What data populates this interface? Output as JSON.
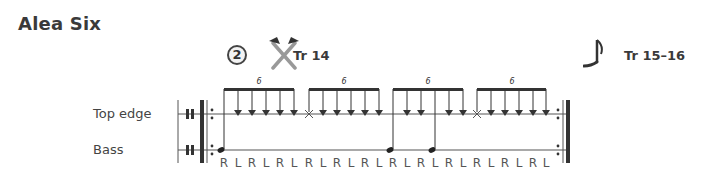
{
  "title": "Alea Six",
  "marker": {
    "number": "2",
    "icon": "crossed-hammers-icon",
    "track_label": "Tr 14"
  },
  "tempo_marker": {
    "icon": "eighth-note-icon",
    "track_label": "Tr 15–16"
  },
  "staves": [
    {
      "label": "Top edge"
    },
    {
      "label": "Bass"
    }
  ],
  "tuplets": [
    "6",
    "6",
    "6",
    "6"
  ],
  "notes": [
    {
      "voice": "bass"
    },
    {
      "voice": "top"
    },
    {
      "voice": "top"
    },
    {
      "voice": "top"
    },
    {
      "voice": "top"
    },
    {
      "voice": "top"
    },
    {
      "voice": "top-x"
    },
    {
      "voice": "top"
    },
    {
      "voice": "top"
    },
    {
      "voice": "top"
    },
    {
      "voice": "top"
    },
    {
      "voice": "top"
    },
    {
      "voice": "bass"
    },
    {
      "voice": "top"
    },
    {
      "voice": "top"
    },
    {
      "voice": "bass"
    },
    {
      "voice": "top"
    },
    {
      "voice": "top"
    },
    {
      "voice": "top-x"
    },
    {
      "voice": "top"
    },
    {
      "voice": "top"
    },
    {
      "voice": "top"
    },
    {
      "voice": "top"
    },
    {
      "voice": "top"
    }
  ],
  "sticking": [
    "R",
    "L",
    "R",
    "L",
    "R",
    "L",
    "R",
    "L",
    "R",
    "L",
    "R",
    "L",
    "R",
    "L",
    "R",
    "L",
    "R",
    "L",
    "R",
    "L",
    "R",
    "L",
    "R",
    "L"
  ]
}
